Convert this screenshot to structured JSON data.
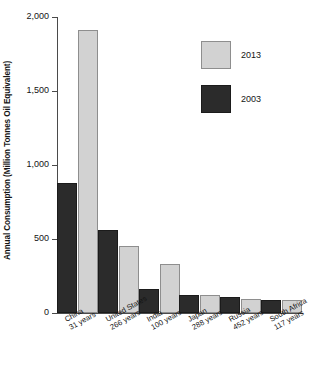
{
  "chart_data": {
    "type": "bar",
    "title": "",
    "xlabel": "",
    "ylabel": "Annual Consumption (Million Tonnes Oil Equivalent)",
    "ylim": [
      0,
      2000
    ],
    "yticks": [
      "0",
      "500",
      "1,000",
      "1,500",
      "2,000"
    ],
    "ytick_values": [
      0,
      500,
      1000,
      1500,
      2000
    ],
    "grid": false,
    "legend_position": "top-right",
    "categories": [
      "China",
      "United States",
      "India",
      "Japan",
      "Russia",
      "South Africa"
    ],
    "category_sublabels": [
      "31 years",
      "266 years",
      "100 years",
      "288 years",
      "452 years",
      "117 years"
    ],
    "series": [
      {
        "name": "2003",
        "color": "#2b2b2b",
        "values": [
          880,
          560,
          165,
          120,
          110,
          90
        ]
      },
      {
        "name": "2013",
        "color": "#d2d2d2",
        "values": [
          1910,
          455,
          330,
          125,
          95,
          88
        ]
      }
    ]
  },
  "axis": {
    "y_title": "Annual Consumption (Million Tonnes Oil Equivalent)"
  },
  "legend": {
    "items": [
      {
        "label": "2013",
        "swatch": "light"
      },
      {
        "label": "2003",
        "swatch": "dark"
      }
    ]
  }
}
